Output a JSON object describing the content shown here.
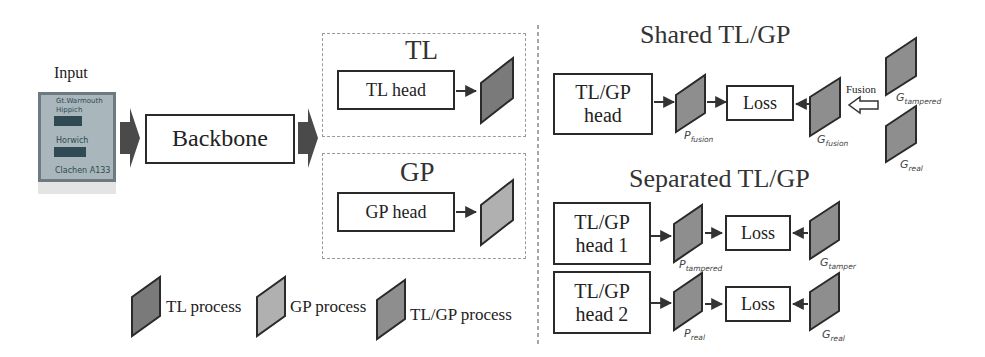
{
  "input": {
    "label": "Input",
    "sign_lines": [
      "Gt.Warmouth",
      "Hippich",
      "Horwich",
      "Clachen A133"
    ]
  },
  "backbone": {
    "label": "Backbone"
  },
  "tl_branch": {
    "title": "TL",
    "head_label": "TL head"
  },
  "gp_branch": {
    "title": "GP",
    "head_label": "GP head"
  },
  "legend": [
    {
      "label": "TL process",
      "color": "#7a7a7a"
    },
    {
      "label": "GP process",
      "color": "#b0b0b0"
    },
    {
      "label": "TL/GP process",
      "color": "#8e8e8e"
    }
  ],
  "shared": {
    "title": "Shared TL/GP",
    "head_label_1": "TL/GP",
    "head_label_2": "head",
    "pred_label": "P_fusion",
    "loss_label": "Loss",
    "gt_label": "G_fusion",
    "fusion_label": "Fusion",
    "gt_tampered_label": "G_tampered",
    "gt_real_label": "G_real"
  },
  "separated": {
    "title": "Separated TL/GP",
    "rows": [
      {
        "head_label_1": "TL/GP",
        "head_label_2": "head 1",
        "pred_label": "P_tampered",
        "loss_label": "Loss",
        "gt_label": "G_tamper"
      },
      {
        "head_label_1": "TL/GP",
        "head_label_2": "head 2",
        "pred_label": "P_real",
        "loss_label": "Loss",
        "gt_label": "G_real"
      }
    ]
  },
  "colors": {
    "tl": "#7a7a7a",
    "gp": "#b0b0b0",
    "tlgp": "#8e8e8e",
    "stroke": "#2a2a2a",
    "arrow": "#444444",
    "dash": "#9a9a9a"
  }
}
